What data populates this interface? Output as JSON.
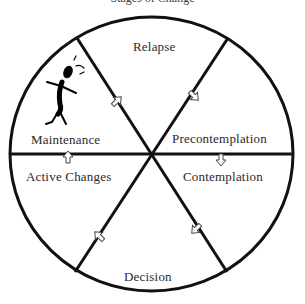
{
  "title": "Stages of Change",
  "stages": [
    {
      "name": "Relapse"
    },
    {
      "name": "Precontemplation"
    },
    {
      "name": "Contemplation"
    },
    {
      "name": "Decision"
    },
    {
      "name": "Active Changes"
    },
    {
      "name": "Maintenance"
    }
  ],
  "colors": {
    "line": "#111111",
    "text": "#2a2a2a",
    "background": "#ffffff"
  },
  "icons": {
    "figure": "stick-figure-icon",
    "arrow": "outline-arrow-icon"
  }
}
